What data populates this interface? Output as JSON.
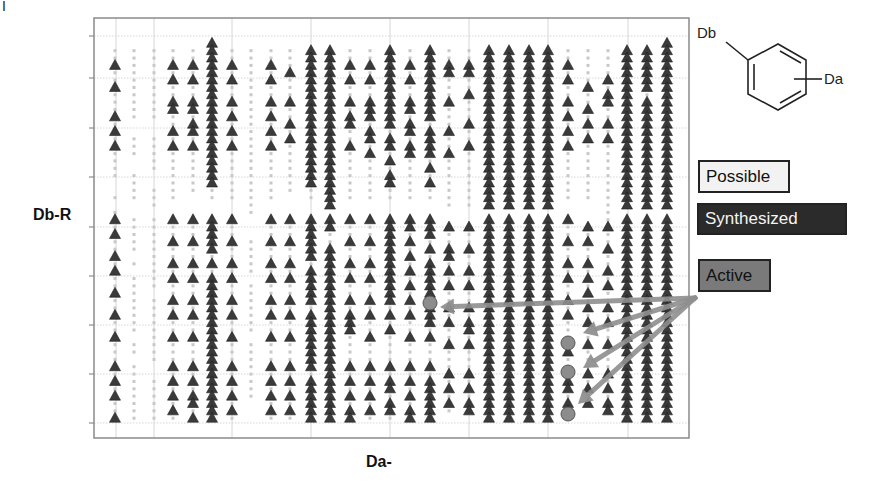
{
  "figure_mark": "I",
  "axes": {
    "ylabel": "Db-R",
    "xlabel": "Da-"
  },
  "legend": {
    "possible": "Possible",
    "synthesized": "Synthesized",
    "active": "Active"
  },
  "molecule": {
    "substituent_b": "Db",
    "substituent_a": "Da"
  },
  "colors": {
    "possible_dot": "#c8c8c8",
    "synthesized_marker": "#3a3a3a",
    "active_marker": "#8c8c8c",
    "arrow": "#8f8f8f",
    "grid": "#d6d6d6",
    "frame": "#8a8a8a"
  },
  "chart_data": {
    "type": "scatter",
    "title": "",
    "xlabel": "Da-",
    "ylabel": "Db-R",
    "grid": true,
    "legend_position": "right",
    "legend": [
      "Possible",
      "Synthesized",
      "Active"
    ],
    "frame": {
      "x0": 94,
      "y0": 18,
      "x1": 689,
      "y1": 438
    },
    "h_gridlines_px": [
      36,
      78,
      128,
      177,
      227,
      276,
      325,
      374,
      423
    ],
    "v_gridlines_px": [
      116,
      154,
      232,
      311,
      390,
      469,
      548,
      628
    ],
    "column_x_px": [
      115,
      134,
      154,
      173,
      193,
      212,
      232,
      251,
      271,
      290,
      311,
      330,
      350,
      370,
      390,
      410,
      430,
      449,
      469,
      489,
      509,
      529,
      548,
      568,
      588,
      608,
      627,
      647,
      667
    ],
    "row_y_top": 36,
    "row_step": 7.35,
    "row_count": 53,
    "columns_note": "per-column string over 53 row slots: '.'=possible, 'S'=synthesized, ' '=empty",
    "columns": [
      "  ..S..S...S.S.S....  . .S.S..S.S..S..S..S...S.S.S..S",
      "  ..........  ...  ....  ..... . ........ .. ........",
      "  ..........  .....  ... .......... .........  ......",
      "  ..S.S..SS..S.S.......  S..S..S.S..S.S..S...S.S.S.S.",
      "  ..S.S..SS.SS.S......   S..S..S.S..S.S..S...S.S.SS.S",
      " SSSSSSSSSSSSSSSSSSSS..  SSSSS.S.SSSSSSSSSSSSSSSSSSSS",
      "  ..S.S..S.S.S.S.......  S..S..S.S..S.S..S...S.S.S.S.",
      "  .......................   ..... ....... ........",
      "  ..S.S..S.S.S.S.......  S..S..S.S..S.S..S...S.S.S.S.",
      "  ...S...S..S.S.......   S..S..S.S..S.S..S...S.S.S.S.",
      "  SSSSSSSSSSSSSSSSSSS..  SSSSSS.SSSSS.SSSSSSSS.SSSSSS",
      "  SSSSSSSSSSSSSSSSSSSSSS SS..SSSSSSSSSSSSSSSSSSSSSSSS",
      "  ..S.S..S.SS..S.......  S..S..S.S..S.SSS....S.S.S.SS",
      "  ..S.S..SSS.SS.S......  S..S..S.S..S.S..S...S.S.S.S.",
      "  SSSSSSSSSSS.SS.S.SS..  SSSSSSSSSSSS.S.S....S.SS.SS.",
      "  ..S.S..SS.SS.SS......  SS.S.S.S.S.S.S..S...S.S.S.SS",
      "  SSSSSSSSSS.SSSS.S.S..  SSS.S.SSSSS.SSS.S...S.SSSSSS",
      "  ..SS...S...S..S.......  S..SS.S.S..S.S..S...S.S.S.",
      "  ..SS..S...S..S........  S..S..S.S..S.SS.S...S.S.SS",
      "  SSSSSSSSSSSSSSSSSSSSSS SSSSSSSSSSSSSSSSSSSSSSSSSSSS",
      "  SSSSSSSSSSSSSSSSSSSSSS SSSSSSSSSSSSSSSSSSSSSSSSSSSS",
      "  SSSSSSSSSSSSSSSSSSSSSS SSSSSSSSSSSSSSSSSSSSSSSSSSSS",
      "  SSSSSSSSSSSSSSSSSSSSSS SSSSSSSSSSSSSSSSSSSSSSSSSSSS",
      "  ..S.S..S.S.S.S.......  S..S..S.S..S.S....S...SS.SS",
      "  .....S..S.S.S........   S.S..S.S.S.S.S..S...S.S.S",
      "  ....S.SS..S.S...........S..S..S.S..S.S..S...S.S.SS",
      "  SSSSSSSSSSSSSSSSSSSSSS SSSSSSSSSSSSSSSSSSSSSSSSSSSS",
      "  SSSSSS.SSSSSSSSSSSSSSS SSSSSSSSSSSSSSSSSSSSSSSSSSSS",
      " SSSSSSSSSSSSSSSSSSSSSSS SSSSSSSSSSSSSSSSSSSSSSSSSSSS"
    ],
    "active_points_px": [
      {
        "x": 430,
        "y": 303
      },
      {
        "x": 568,
        "y": 343
      },
      {
        "x": 568,
        "y": 372
      },
      {
        "x": 568,
        "y": 414
      }
    ],
    "arrows_px": {
      "origin": {
        "x": 695,
        "y": 298
      },
      "tips": [
        {
          "x": 440,
          "y": 307
        },
        {
          "x": 583,
          "y": 333
        },
        {
          "x": 583,
          "y": 368
        },
        {
          "x": 578,
          "y": 404
        }
      ]
    }
  }
}
